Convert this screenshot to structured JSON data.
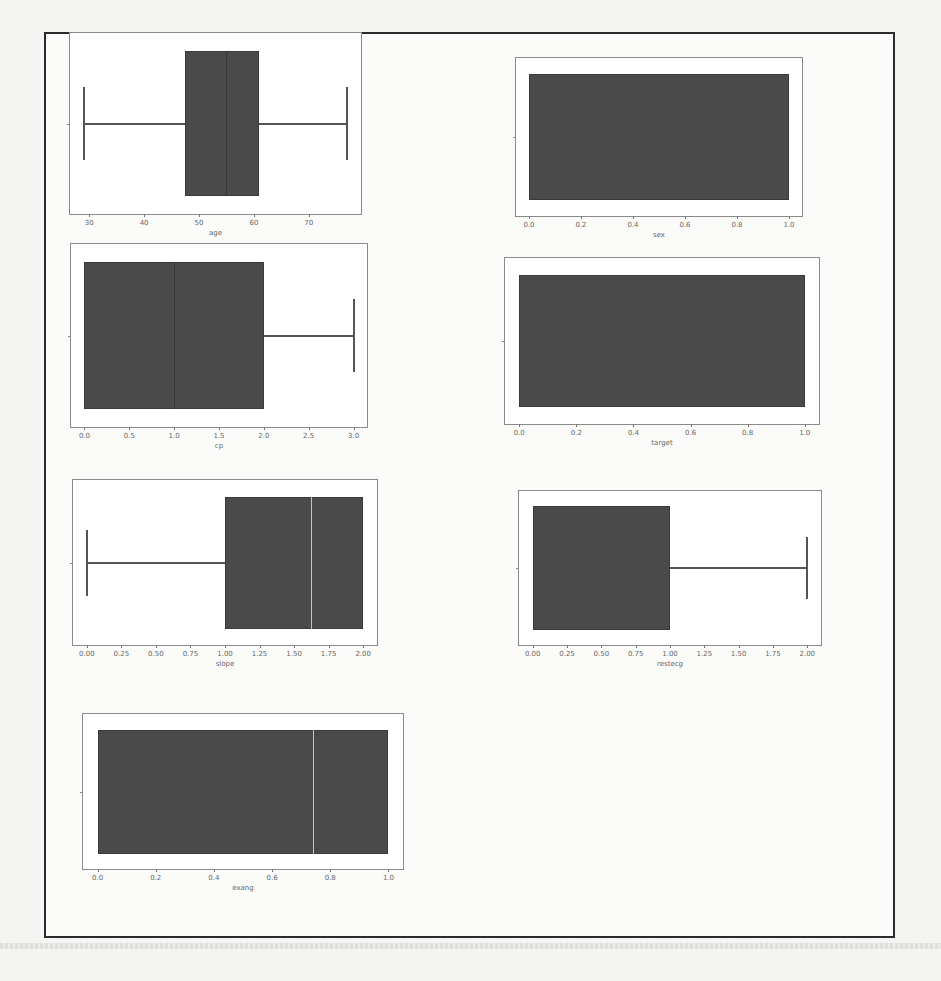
{
  "chart_data": [
    {
      "type": "box",
      "id": "age",
      "xlabel": "age",
      "xlim": [
        26.5,
        79.5
      ],
      "ticks": [
        30,
        40,
        50,
        60,
        70
      ],
      "tick_labels": [
        "30",
        "40",
        "50",
        "60",
        "70"
      ],
      "whisker_low": 29,
      "q1": 47.5,
      "median": 55,
      "q3": 61,
      "whisker_high": 77,
      "box": {
        "left": 69,
        "top": 32,
        "width": 293,
        "height": 183
      },
      "median_style": "dark"
    },
    {
      "type": "box",
      "id": "sex",
      "xlabel": "sex",
      "xlim": [
        -0.05,
        1.05
      ],
      "ticks": [
        0.0,
        0.2,
        0.4,
        0.6,
        0.8,
        1.0
      ],
      "tick_labels": [
        "0.0",
        "0.2",
        "0.4",
        "0.6",
        "0.8",
        "1.0"
      ],
      "whisker_low": 0,
      "q1": 0,
      "median": 1,
      "q3": 1,
      "whisker_high": 1,
      "box": {
        "left": 515,
        "top": 57,
        "width": 288,
        "height": 160
      },
      "median_style": "none"
    },
    {
      "type": "box",
      "id": "cp",
      "xlabel": "cp",
      "xlim": [
        -0.15,
        3.15
      ],
      "ticks": [
        0.0,
        0.5,
        1.0,
        1.5,
        2.0,
        2.5,
        3.0
      ],
      "tick_labels": [
        "0.0",
        "0.5",
        "1.0",
        "1.5",
        "2.0",
        "2.5",
        "3.0"
      ],
      "whisker_low": 0,
      "q1": 0,
      "median": 1,
      "q3": 2,
      "whisker_high": 3,
      "box": {
        "left": 70,
        "top": 243,
        "width": 298,
        "height": 185
      },
      "median_style": "dark"
    },
    {
      "type": "box",
      "id": "target",
      "xlabel": "target",
      "xlim": [
        -0.05,
        1.05
      ],
      "ticks": [
        0.0,
        0.2,
        0.4,
        0.6,
        0.8,
        1.0
      ],
      "tick_labels": [
        "0.0",
        "0.2",
        "0.4",
        "0.6",
        "0.8",
        "1.0"
      ],
      "whisker_low": 0,
      "q1": 0,
      "median": 1,
      "q3": 1,
      "whisker_high": 1,
      "box": {
        "left": 504,
        "top": 257,
        "width": 316,
        "height": 168
      },
      "median_style": "none"
    },
    {
      "type": "box",
      "id": "slope",
      "xlabel": "slope",
      "xlim": [
        -0.1,
        2.1
      ],
      "ticks": [
        0.0,
        0.25,
        0.5,
        0.75,
        1.0,
        1.25,
        1.5,
        1.75,
        2.0
      ],
      "tick_labels": [
        "0.00",
        "0.25",
        "0.50",
        "0.75",
        "1.00",
        "1.25",
        "1.50",
        "1.75",
        "2.00"
      ],
      "whisker_low": 0,
      "q1": 1,
      "median": 1.62,
      "q3": 2,
      "whisker_high": 2,
      "box": {
        "left": 72,
        "top": 479,
        "width": 306,
        "height": 167
      },
      "median_style": "light"
    },
    {
      "type": "box",
      "id": "restecg",
      "xlabel": "restecg",
      "xlim": [
        -0.1,
        2.1
      ],
      "ticks": [
        0.0,
        0.25,
        0.5,
        0.75,
        1.0,
        1.25,
        1.5,
        1.75,
        2.0
      ],
      "tick_labels": [
        "0.00",
        "0.25",
        "0.50",
        "0.75",
        "1.00",
        "1.25",
        "1.50",
        "1.75",
        "2.00"
      ],
      "whisker_low": 0,
      "q1": 0,
      "median": 1,
      "q3": 1,
      "whisker_high": 2,
      "box": {
        "left": 518,
        "top": 490,
        "width": 304,
        "height": 156
      },
      "median_style": "none"
    },
    {
      "type": "box",
      "id": "exang",
      "xlabel": "exang",
      "xlim": [
        -0.05,
        1.05
      ],
      "ticks": [
        0.0,
        0.2,
        0.4,
        0.6,
        0.8,
        1.0
      ],
      "tick_labels": [
        "0.0",
        "0.2",
        "0.4",
        "0.6",
        "0.8",
        "1.0"
      ],
      "whisker_low": 0,
      "q1": 0,
      "median": 0.74,
      "q3": 1,
      "whisker_high": 1,
      "box": {
        "left": 82,
        "top": 713,
        "width": 322,
        "height": 157
      },
      "median_style": "light"
    }
  ]
}
